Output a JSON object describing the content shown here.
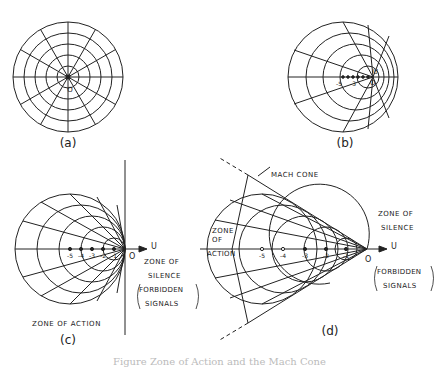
{
  "figure": {
    "caption": "Figure   Zone of Action and the Mach Cone",
    "panels": {
      "a": {
        "label": "(a)",
        "origin_label": "O"
      },
      "b": {
        "label": "(b)",
        "origin_label": "O",
        "velocity_label": "U",
        "ticks": [
          "-5",
          "-3"
        ]
      },
      "c": {
        "label": "(c)",
        "origin_label": "O",
        "axis_label": "U",
        "ticks": [
          "-5",
          "-4",
          "-3",
          "-2",
          "-1"
        ],
        "zone_of_action": "ZONE OF ACTION",
        "zone_of_silence_1": "ZONE OF",
        "zone_of_silence_2": "SILENCE",
        "forbidden_1": "FORBIDDEN",
        "forbidden_2": "SIGNALS"
      },
      "d": {
        "label": "(d)",
        "origin_label": "O",
        "axis_label": "U",
        "ticks": [
          "-5",
          "-4",
          "-3",
          "-2",
          "-1"
        ],
        "mach_cone": "MACH CONE",
        "zone_of_action_1": "ZONE",
        "zone_of_action_2": "OF",
        "zone_of_action_3": "ACTION",
        "zone_of_silence_1": "ZONE OF",
        "zone_of_silence_2": "SILENCE",
        "forbidden_1": "FORBIDDEN",
        "forbidden_2": "SIGNALS"
      }
    }
  }
}
